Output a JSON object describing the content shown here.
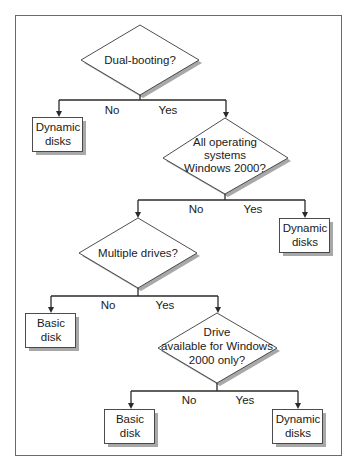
{
  "diagram": {
    "type": "flowchart",
    "decisions": [
      {
        "id": "d1",
        "lines": [
          "Dual-booting?"
        ]
      },
      {
        "id": "d2",
        "lines": [
          "All operating",
          "systems",
          "Windows 2000?"
        ]
      },
      {
        "id": "d3",
        "lines": [
          "Multiple drives?"
        ]
      },
      {
        "id": "d4",
        "lines": [
          "Drive",
          "available for Windows",
          "2000 only?"
        ]
      }
    ],
    "outcomes": [
      {
        "id": "o1",
        "lines": [
          "Dynamic",
          "disks"
        ]
      },
      {
        "id": "o2",
        "lines": [
          "Dynamic",
          "disks"
        ]
      },
      {
        "id": "o3",
        "lines": [
          "Basic",
          "disk"
        ]
      },
      {
        "id": "o4",
        "lines": [
          "Basic",
          "disk"
        ]
      },
      {
        "id": "o5",
        "lines": [
          "Dynamic",
          "disks"
        ]
      }
    ],
    "branches": [
      {
        "from": "d1",
        "no": "Dynamic disks (o1)",
        "yes": "d2",
        "no_label": "No",
        "yes_label": "Yes"
      },
      {
        "from": "d2",
        "no": "d3",
        "yes": "Dynamic disks (o2)",
        "no_label": "No",
        "yes_label": "Yes"
      },
      {
        "from": "d3",
        "no": "Basic disk (o3)",
        "yes": "d4",
        "no_label": "No",
        "yes_label": "Yes"
      },
      {
        "from": "d4",
        "no": "Basic disk (o4)",
        "yes": "Dynamic disks (o5)",
        "no_label": "No",
        "yes_label": "Yes"
      }
    ]
  }
}
